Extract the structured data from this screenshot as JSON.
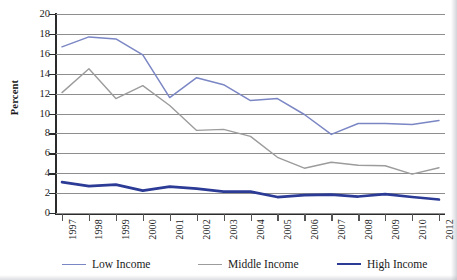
{
  "title_partial": "",
  "axes": {
    "ylabel": "Percent",
    "yticks": [
      "20",
      "18",
      "16",
      "14",
      "12",
      "10",
      "8",
      "6",
      "4",
      "2",
      "0"
    ],
    "xticks": [
      "1997",
      "1998",
      "1999",
      "2000",
      "2001",
      "2002",
      "2003",
      "2004",
      "2005",
      "2006",
      "2007",
      "2008",
      "2009",
      "2010",
      "2012"
    ]
  },
  "legend": {
    "items": [
      {
        "label": "Low Income",
        "color": "#7b86c4"
      },
      {
        "label": "Middle Income",
        "color": "#9c9c9c"
      },
      {
        "label": "High Income",
        "color": "#2b3b96"
      }
    ]
  },
  "colors": {
    "low_income": "#7b86c4",
    "middle_income": "#9c9c9c",
    "high_income": "#2b3b96",
    "gridline": "#8e8e8e",
    "axis": "#2b2b2b"
  },
  "chart_data": {
    "type": "line",
    "title": "",
    "xlabel": "",
    "ylabel": "Percent",
    "ylim": [
      0,
      20
    ],
    "ytick_step": 2,
    "grid": true,
    "legend_position": "bottom",
    "categories": [
      "1997",
      "1998",
      "1999",
      "2000",
      "2001",
      "2002",
      "2003",
      "2004",
      "2005",
      "2006",
      "2007",
      "2008",
      "2009",
      "2010",
      "2012"
    ],
    "series": [
      {
        "name": "Low Income",
        "color": "#7b86c4",
        "values": [
          16.7,
          17.7,
          17.5,
          15.9,
          11.6,
          13.6,
          12.9,
          11.3,
          11.5,
          9.9,
          7.9,
          9.0,
          9.0,
          8.9,
          9.3
        ]
      },
      {
        "name": "Middle Income",
        "color": "#9c9c9c",
        "values": [
          12.1,
          14.5,
          11.5,
          12.8,
          10.8,
          8.3,
          8.4,
          7.7,
          5.6,
          4.5,
          5.1,
          4.8,
          4.75,
          3.9,
          4.55
        ]
      },
      {
        "name": "High Income",
        "color": "#2b3b96",
        "values": [
          3.1,
          2.7,
          2.85,
          2.25,
          2.65,
          2.45,
          2.15,
          2.15,
          1.6,
          1.8,
          1.85,
          1.65,
          1.9,
          1.6,
          1.35
        ]
      }
    ]
  }
}
